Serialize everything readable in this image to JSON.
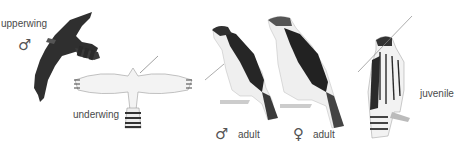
{
  "figure": {
    "labels": {
      "upperwing": "upperwing",
      "underwing": "underwing",
      "male_adult": "adult",
      "female_adult": "adult",
      "juvenile": "juvenile"
    },
    "symbols": {
      "male": "♂",
      "female": "♀"
    },
    "colors": {
      "background": "#ffffff",
      "ink_dark": "#2a2a2a",
      "ink_mid": "#6a6a6a",
      "ink_light": "#bdbdbd",
      "text": "#4a4a4a"
    }
  }
}
